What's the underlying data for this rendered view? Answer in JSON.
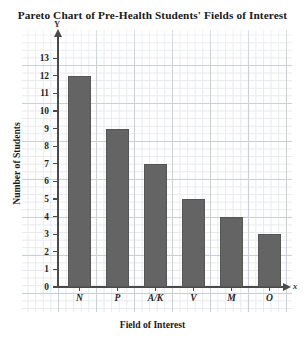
{
  "chart_data": {
    "type": "bar",
    "title": "Pareto Chart of Pre-Health Students' Fields of Interest",
    "xlabel": "Field of Interest",
    "ylabel": "Number of Students",
    "categories": [
      "N",
      "P",
      "A/K",
      "V",
      "M",
      "O"
    ],
    "values": [
      12,
      9,
      7,
      5,
      4,
      3
    ],
    "ylim": [
      0,
      13
    ],
    "ytick_labels": [
      "0",
      "1",
      "2",
      "3",
      "4",
      "5",
      "6",
      "7",
      "8",
      "9",
      "10",
      "11",
      "12",
      "13"
    ],
    "ytick_values": [
      0,
      1,
      2,
      3,
      4,
      5,
      6,
      7,
      8,
      9,
      10,
      11,
      12,
      13
    ],
    "grid": true,
    "legend": null,
    "axis_letters": {
      "y": "Y",
      "x": "x"
    },
    "bar_color": "#646464",
    "grid_major_color": "#c9cdd4",
    "grid_minor_color": "#e6e9ee",
    "axis_color": "#4a4a4a"
  }
}
